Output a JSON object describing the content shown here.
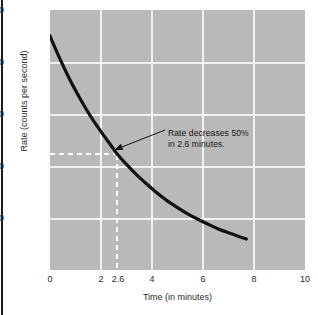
{
  "chart_data": {
    "type": "line",
    "title": "",
    "xlabel": "Time (in minutes)",
    "ylabel": "Rate (counts per second)",
    "xlim": [
      0,
      10
    ],
    "ylim": [
      0,
      5000
    ],
    "xticks": [
      0,
      2,
      2.6,
      4,
      6,
      8,
      10
    ],
    "xtick_labels": [
      "0",
      "2",
      "2.6",
      "4",
      "6",
      "8",
      "10"
    ],
    "yticks": [
      1000,
      2000,
      3000,
      4000,
      5000
    ],
    "ytick_labels": [
      "1000",
      "2000",
      "3000",
      "4000",
      "5000"
    ],
    "grid": true,
    "gridlines_x": [
      2,
      4,
      6,
      8
    ],
    "gridlines_y": [
      1000,
      2000,
      3000,
      4000
    ],
    "legend": null,
    "series": [
      {
        "name": "decay-rate",
        "x": [
          0.0,
          0.4,
          0.8,
          1.2,
          1.6,
          2.0,
          2.4,
          2.6,
          3.0,
          3.4,
          3.8,
          4.2,
          4.6,
          5.0,
          5.4,
          5.8,
          6.2,
          6.6,
          7.0,
          7.4,
          7.7
        ],
        "values": [
          4500,
          4050,
          3640,
          3280,
          2950,
          2660,
          2390,
          2250,
          2030,
          1830,
          1650,
          1480,
          1330,
          1200,
          1080,
          975,
          880,
          790,
          715,
          645,
          595
        ]
      }
    ],
    "annotations": [
      {
        "name": "half-life-callout",
        "line1": "Rate decreases 50%",
        "line2": "in 2.6 minutes.",
        "points_to_x": 2.6,
        "points_to_y": 2250
      }
    ],
    "guides": [
      {
        "name": "half-rate-horizontal",
        "orientation": "horizontal",
        "value": 2250,
        "style": "dashed"
      },
      {
        "name": "half-life-vertical",
        "orientation": "vertical",
        "value": 2.6,
        "style": "dashed"
      }
    ],
    "colors": {
      "plot_background": "#b9b9b9",
      "gridline": "#f2f2f2",
      "curve": "#111111",
      "guide": "#ffffff",
      "text": "#2b2b2b",
      "page_background": "#ffffff"
    }
  }
}
